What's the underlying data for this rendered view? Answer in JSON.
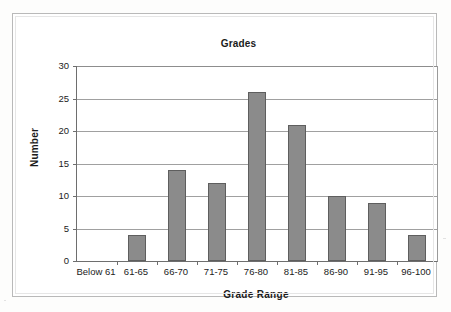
{
  "chart_data": {
    "type": "bar",
    "title": "Grades",
    "xlabel": "Grade Range",
    "ylabel": "Number",
    "categories": [
      "Below 61",
      "61-65",
      "66-70",
      "71-75",
      "76-80",
      "81-85",
      "86-90",
      "91-95",
      "96-100"
    ],
    "values": [
      0,
      4,
      14,
      12,
      26,
      21,
      10,
      9,
      4
    ],
    "ylim": [
      0,
      30
    ],
    "ytick_labels": [
      "0",
      "5",
      "10",
      "15",
      "20",
      "25",
      "30"
    ],
    "ytick_values": [
      0,
      5,
      10,
      15,
      20,
      25,
      30
    ],
    "grid": true,
    "legend": false,
    "bar_color": "#8b8b8b",
    "bar_border_color": "#5e5e5e",
    "axis_color": "#6e6e6e",
    "gridline_color": "#a0a0a0",
    "plot_background": "#ffffff",
    "frame_color": "#b9b9b9"
  }
}
